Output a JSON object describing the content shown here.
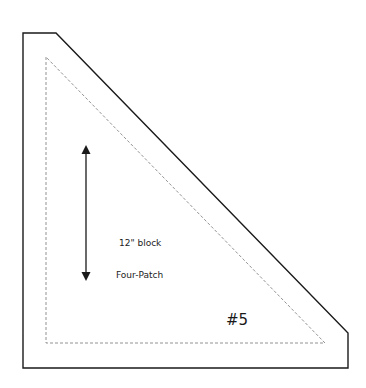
{
  "pattern_piece": {
    "block_size": "12\" block",
    "block_name": "Four-Patch",
    "piece_number": "#5",
    "grain_arrow": "vertical-double-arrow-icon",
    "outline": {
      "cut_line": "solid",
      "seam_line": "dashed",
      "cut_color": "#1a1a1a",
      "seam_color": "#777777"
    }
  }
}
